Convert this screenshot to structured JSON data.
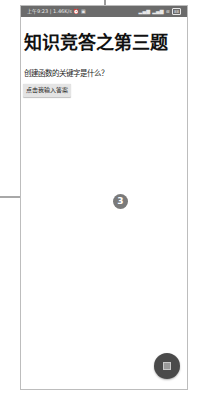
{
  "status_bar": {
    "time": "上午9:23",
    "network_speed": "1.46K/s",
    "left_icons": [
      "alarm-icon",
      "notification-icon"
    ],
    "signal_1": "📶",
    "signal_2": "📶",
    "wifi": "wifi",
    "battery": "88"
  },
  "page": {
    "title": "知识竞答之第三题",
    "question": "创建函数的关键字是什么？",
    "answer_button_label": "点击我输入答案"
  },
  "annotation": {
    "badge_number": "3"
  },
  "fab": {
    "icon": "stop-icon"
  },
  "colors": {
    "status_bar_bg": "#6b6b6b",
    "button_bg": "#e4e4e4",
    "fab_bg": "#4a4a4a",
    "badge_bg": "#7a7a7a"
  }
}
